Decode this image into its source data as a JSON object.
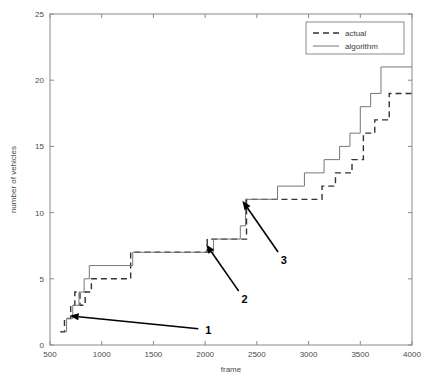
{
  "chart_data": {
    "type": "line",
    "title": "",
    "xlabel": "frame",
    "ylabel": "number of vehicles",
    "xlim": [
      500,
      4000
    ],
    "ylim": [
      0,
      25
    ],
    "grid": false,
    "legend_position": "top-right",
    "xticks": [
      500,
      1000,
      1500,
      2000,
      2500,
      3000,
      3500,
      4000
    ],
    "xticklabels": [
      "500",
      "1000",
      "1500",
      "2000",
      "2500",
      "3000",
      "3500",
      "4000"
    ],
    "yticks": [
      0,
      5,
      10,
      15,
      20,
      25
    ],
    "yticklabels": [
      "0",
      "5",
      "10",
      "15",
      "20",
      "25"
    ],
    "series": [
      {
        "name": "actual",
        "style": "dashed",
        "color": "#333333",
        "drawstyle": "steps-post",
        "x": [
          600,
          640,
          700,
          740,
          790,
          840,
          900,
          1280,
          2020,
          2330,
          2400,
          2660,
          2900,
          3130,
          3260,
          3420,
          3530,
          3640,
          3780,
          4000
        ],
        "y": [
          1,
          2,
          3,
          4,
          3,
          4,
          5,
          7,
          8,
          8,
          11,
          11,
          11,
          12,
          13,
          14,
          16,
          17,
          19,
          19
        ]
      },
      {
        "name": "algorithm",
        "style": "solid",
        "color": "#777777",
        "drawstyle": "steps-post",
        "x": [
          620,
          660,
          720,
          780,
          830,
          880,
          1300,
          2050,
          2080,
          2340,
          2390,
          2700,
          2960,
          3150,
          3300,
          3400,
          3500,
          3600,
          3700,
          4000
        ],
        "y": [
          1,
          2,
          3,
          4,
          5,
          6,
          7,
          7,
          8,
          9,
          11,
          12,
          13,
          14,
          15,
          16,
          18,
          19,
          21,
          21
        ]
      }
    ],
    "annotations": [
      {
        "label": "1",
        "label_x": 2030,
        "label_y": 1.15,
        "tip_x": 690,
        "tip_y": 2.2
      },
      {
        "label": "2",
        "label_x": 2380,
        "label_y": 3.45,
        "tip_x": 2010,
        "tip_y": 7.6
      },
      {
        "label": "3",
        "label_x": 2760,
        "label_y": 6.4,
        "tip_x": 2360,
        "tip_y": 10.9
      }
    ]
  },
  "legend": {
    "entries": [
      {
        "label": "actual"
      },
      {
        "label": "algorithm"
      }
    ]
  },
  "axes": {
    "x_title": "frame",
    "y_title": "number of vehicles"
  }
}
